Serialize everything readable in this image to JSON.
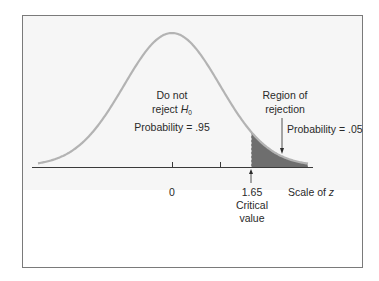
{
  "figure": {
    "type": "normal-distribution-hypothesis-test",
    "colors": {
      "frame_border": "#7a7a7a",
      "frame_fill": "#f4f4f4",
      "curve": "#b0b0b0",
      "axis": "#3a3a3a",
      "rejection_fill": "#6e6e6e",
      "text": "#2a2a2a"
    },
    "labels": {
      "do_not_line1": "Do not",
      "do_not_line2_prefix": "reject ",
      "do_not_line2_symbol": "H",
      "do_not_line2_subscript": "0",
      "prob_accept": "Probability = .95",
      "region_line1": "Region of",
      "region_line2": "rejection",
      "prob_reject": "Probability = .05",
      "tick_zero": "0",
      "tick_critical": "1.65",
      "critical_line1": "Critical",
      "critical_line2": "value",
      "scale_prefix": "Scale of ",
      "scale_var": "z"
    }
  },
  "chart_data": {
    "type": "area",
    "title": "",
    "xlabel": "Scale of z",
    "ylabel": "",
    "distribution": "standard normal",
    "ticks": [
      {
        "value": 0,
        "label": "0"
      },
      {
        "value": 1,
        "label": ""
      },
      {
        "value": 1.65,
        "label": "1.65"
      }
    ],
    "critical_value": 1.65,
    "regions": [
      {
        "name": "Do not reject H0",
        "probability": 0.95,
        "range": [
          null,
          1.65
        ],
        "shaded": false
      },
      {
        "name": "Region of rejection",
        "probability": 0.05,
        "range": [
          1.65,
          null
        ],
        "shaded": true
      }
    ],
    "annotations": [
      "Do not reject H0",
      "Probability = .95",
      "Region of rejection",
      "Probability = .05",
      "Critical value"
    ],
    "grid": false,
    "legend": null
  }
}
